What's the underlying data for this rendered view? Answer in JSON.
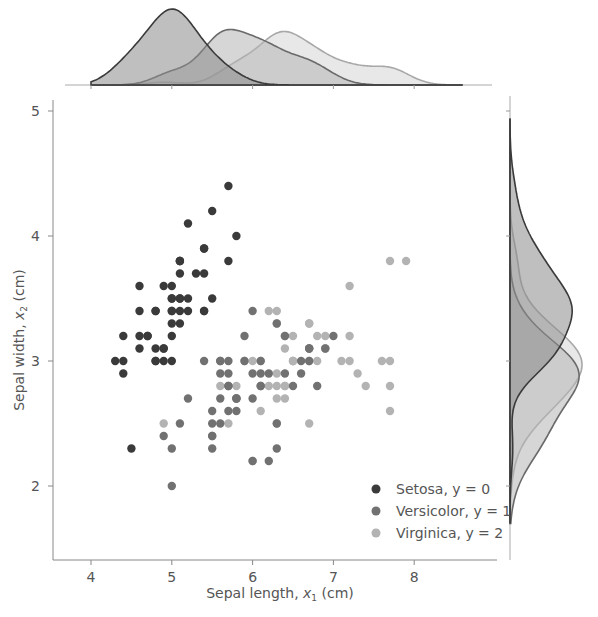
{
  "chart_data": {
    "type": "scatter",
    "title": "",
    "xlabel": "Sepal length, x₁ (cm)",
    "ylabel": "Sepal width, x₂ (cm)",
    "xlim": [
      3.5,
      9.0
    ],
    "ylim": [
      1.4,
      5.1
    ],
    "xticks": [
      4,
      5,
      6,
      7,
      8
    ],
    "yticks": [
      2,
      3,
      4,
      5
    ],
    "grid": false,
    "legend_position": "lower right",
    "marginals": {
      "top": "kde of sepal length per class",
      "right": "kde of sepal width per class"
    },
    "series": [
      {
        "name": "Setosa, y = 0",
        "color": "#3a3a3a",
        "x": [
          5.1,
          4.9,
          4.7,
          4.6,
          5.0,
          5.4,
          4.6,
          5.0,
          4.4,
          4.9,
          5.4,
          4.8,
          4.8,
          4.3,
          5.8,
          5.7,
          5.4,
          5.1,
          5.7,
          5.1,
          5.4,
          5.1,
          4.6,
          5.1,
          4.8,
          5.0,
          5.0,
          5.2,
          5.2,
          4.7,
          4.8,
          5.4,
          5.2,
          5.5,
          4.9,
          5.0,
          5.5,
          4.9,
          4.4,
          5.1,
          5.0,
          4.5,
          4.4,
          5.0,
          5.1,
          4.8,
          5.1,
          4.6,
          5.3,
          5.0
        ],
        "y": [
          3.5,
          3.0,
          3.2,
          3.1,
          3.6,
          3.9,
          3.4,
          3.4,
          2.9,
          3.1,
          3.7,
          3.4,
          3.0,
          3.0,
          4.0,
          4.4,
          3.9,
          3.5,
          3.8,
          3.8,
          3.4,
          3.7,
          3.6,
          3.3,
          3.4,
          3.0,
          3.4,
          3.5,
          3.4,
          3.2,
          3.1,
          3.4,
          4.1,
          4.2,
          3.1,
          3.2,
          3.5,
          3.6,
          3.0,
          3.4,
          3.5,
          2.3,
          3.2,
          3.5,
          3.8,
          3.0,
          3.8,
          3.2,
          3.7,
          3.3
        ]
      },
      {
        "name": "Versicolor, y = 1",
        "color": "#717171",
        "x": [
          7.0,
          6.4,
          6.9,
          5.5,
          6.5,
          5.7,
          6.3,
          4.9,
          6.6,
          5.2,
          5.0,
          5.9,
          6.0,
          6.1,
          5.6,
          6.7,
          5.6,
          5.8,
          6.2,
          5.6,
          5.9,
          6.1,
          6.3,
          6.1,
          6.4,
          6.6,
          6.8,
          6.7,
          6.0,
          5.7,
          5.5,
          5.5,
          5.8,
          6.0,
          5.4,
          6.0,
          6.7,
          6.3,
          5.6,
          5.5,
          5.5,
          6.1,
          5.8,
          5.0,
          5.6,
          5.7,
          5.7,
          6.2,
          5.1,
          5.7
        ],
        "y": [
          3.2,
          3.2,
          3.1,
          2.3,
          2.8,
          2.8,
          3.3,
          2.4,
          2.9,
          2.7,
          2.0,
          3.0,
          2.2,
          2.9,
          2.9,
          3.1,
          3.0,
          2.7,
          2.2,
          2.5,
          3.2,
          2.8,
          2.5,
          2.8,
          2.9,
          3.0,
          2.8,
          3.0,
          2.9,
          2.6,
          2.4,
          2.4,
          2.7,
          2.7,
          3.0,
          3.4,
          3.1,
          2.3,
          3.0,
          2.5,
          2.6,
          3.0,
          2.6,
          2.3,
          2.7,
          3.0,
          2.9,
          2.9,
          2.5,
          2.8
        ]
      },
      {
        "name": "Virginica, y = 2",
        "color": "#b3b3b3",
        "x": [
          6.3,
          5.8,
          7.1,
          6.3,
          6.5,
          7.6,
          4.9,
          7.3,
          6.7,
          7.2,
          6.5,
          6.4,
          6.8,
          5.7,
          5.8,
          6.4,
          6.5,
          7.7,
          7.7,
          6.0,
          6.9,
          5.6,
          7.7,
          6.3,
          6.7,
          7.2,
          6.2,
          6.1,
          6.4,
          7.2,
          7.4,
          7.9,
          6.4,
          6.3,
          6.1,
          7.7,
          6.3,
          6.4,
          6.0,
          6.9,
          6.7,
          6.9,
          5.8,
          6.8,
          6.7,
          6.7,
          6.3,
          6.5,
          6.2,
          5.9
        ],
        "y": [
          3.3,
          2.7,
          3.0,
          2.9,
          3.0,
          3.0,
          2.5,
          2.9,
          2.5,
          3.6,
          3.2,
          2.7,
          3.0,
          2.5,
          2.8,
          3.2,
          3.0,
          3.8,
          2.6,
          2.2,
          3.2,
          2.8,
          2.8,
          2.7,
          3.3,
          3.2,
          2.8,
          3.0,
          2.8,
          3.0,
          2.8,
          3.8,
          2.8,
          2.8,
          2.6,
          3.0,
          3.4,
          3.1,
          3.0,
          3.1,
          3.1,
          3.1,
          2.7,
          3.2,
          3.3,
          3.0,
          2.5,
          3.0,
          3.4,
          3.0
        ]
      }
    ]
  },
  "legend": {
    "items": [
      {
        "label": "Setosa, y = 0",
        "color": "#3a3a3a"
      },
      {
        "label": "Versicolor, y = 1",
        "color": "#717171"
      },
      {
        "label": "Virginica, y = 2",
        "color": "#b3b3b3"
      }
    ]
  },
  "axes": {
    "xlabel_main": "Sepal length, ",
    "xlabel_var": "x",
    "xlabel_sub": "1",
    "xlabel_unit": " (cm)",
    "ylabel_main": "Sepal width, ",
    "ylabel_var": "x",
    "ylabel_sub": "2",
    "ylabel_unit": " (cm)",
    "xtick_labels": [
      "4",
      "5",
      "6",
      "7",
      "8"
    ],
    "ytick_labels": [
      "2",
      "3",
      "4",
      "5"
    ]
  }
}
